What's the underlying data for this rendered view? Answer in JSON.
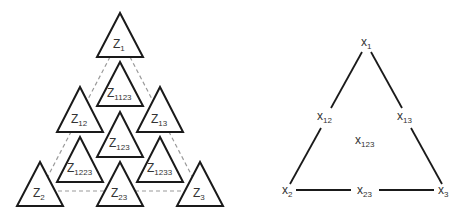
{
  "left_diagram": {
    "title": "",
    "nodes": [
      {
        "id": "z1",
        "base": "Z",
        "sub": "1",
        "apex": [
          120,
          13
        ]
      },
      {
        "id": "z1123",
        "base": "Z",
        "sub": "1123",
        "apex": [
          120,
          62
        ]
      },
      {
        "id": "z12",
        "base": "Z",
        "sub": "12",
        "apex": [
          80,
          87
        ]
      },
      {
        "id": "z13",
        "base": "Z",
        "sub": "13",
        "apex": [
          160,
          87
        ]
      },
      {
        "id": "z123",
        "base": "Z",
        "sub": "123",
        "apex": [
          120,
          112
        ]
      },
      {
        "id": "z1223",
        "base": "Z",
        "sub": "1223",
        "apex": [
          80,
          137
        ]
      },
      {
        "id": "z1233",
        "base": "Z",
        "sub": "1233",
        "apex": [
          160,
          137
        ]
      },
      {
        "id": "z2",
        "base": "Z",
        "sub": "2",
        "apex": [
          40,
          162
        ]
      },
      {
        "id": "z23",
        "base": "Z",
        "sub": "23",
        "apex": [
          120,
          162
        ]
      },
      {
        "id": "z3",
        "base": "Z",
        "sub": "3",
        "apex": [
          200,
          162
        ]
      }
    ],
    "dashed_outline": "triangle connecting Z1, Z2, Z3"
  },
  "right_diagram": {
    "nodes": [
      {
        "id": "x1",
        "base": "x",
        "sub": "1"
      },
      {
        "id": "x12",
        "base": "x",
        "sub": "12"
      },
      {
        "id": "x13",
        "base": "x",
        "sub": "13"
      },
      {
        "id": "x123",
        "base": "x",
        "sub": "123"
      },
      {
        "id": "x2",
        "base": "x",
        "sub": "2"
      },
      {
        "id": "x23",
        "base": "x",
        "sub": "23"
      },
      {
        "id": "x3",
        "base": "x",
        "sub": "3"
      }
    ],
    "edges": [
      [
        "x1",
        "x12"
      ],
      [
        "x12",
        "x2"
      ],
      [
        "x1",
        "x13"
      ],
      [
        "x13",
        "x3"
      ],
      [
        "x2",
        "x23"
      ],
      [
        "x23",
        "x3"
      ]
    ]
  },
  "colors": {
    "stroke": "#1a1a1a",
    "dashed": "#9a9a9a",
    "text": "#333333",
    "background": "#ffffff"
  }
}
